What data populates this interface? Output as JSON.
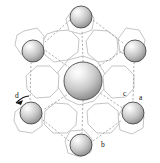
{
  "figure": {
    "background_color": "#ffffff",
    "width": 160,
    "height": 163
  },
  "labels": [
    {
      "id": "label-a",
      "text": "a",
      "x": 139,
      "y": 100
    },
    {
      "id": "label-b",
      "text": "b",
      "x": 101,
      "y": 147
    },
    {
      "id": "label-c",
      "text": "c",
      "x": 124,
      "y": 96
    },
    {
      "id": "label-d",
      "text": "d",
      "x": 16,
      "y": 99
    }
  ],
  "colors": {
    "ring_stroke": "#bdbdbd",
    "bond_stroke": "#9a9a9a",
    "atom_outline": "#4a4a4a",
    "atom_light": "#ffffff",
    "atom_mid": "#c9c9c9",
    "atom_dark": "#808080",
    "label_color": "#111111",
    "arrow_color": "#111111"
  },
  "atoms": {
    "central": {
      "name": "central-large-atom",
      "cx": 83,
      "cy": 81,
      "r": 19
    },
    "outer": [
      {
        "name": "atom-top",
        "cx": 81,
        "cy": 17,
        "r": 11
      },
      {
        "name": "atom-upper-left",
        "cx": 33,
        "cy": 51,
        "r": 11
      },
      {
        "name": "atom-upper-right",
        "cx": 135,
        "cy": 51,
        "r": 11
      },
      {
        "name": "atom-lower-left",
        "cx": 31,
        "cy": 113,
        "r": 11
      },
      {
        "name": "atom-lower-right",
        "cx": 133,
        "cy": 113,
        "r": 11
      },
      {
        "name": "atom-bottom",
        "cx": 81,
        "cy": 145,
        "r": 11
      }
    ]
  },
  "rings": {
    "count": 13,
    "description": "hexagonal and octagonal channel outlines forming the framework"
  },
  "bonds": {
    "count": 12,
    "style": "dashed"
  },
  "axis_arrow": {
    "name": "axis-indicator-d",
    "description": "small black arrow pointing to vertical dashed channel labelled d"
  }
}
